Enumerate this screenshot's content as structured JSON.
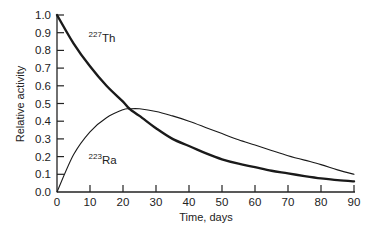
{
  "chart_data": {
    "type": "line",
    "title": "",
    "xlabel": "Time, days",
    "ylabel": "Relative activity",
    "xlim": [
      0,
      90
    ],
    "ylim": [
      0.0,
      1.0
    ],
    "grid": false,
    "legend": "inline labels",
    "x_ticks": [
      0,
      10,
      20,
      30,
      40,
      50,
      60,
      70,
      80,
      90
    ],
    "x_tick_labels": [
      "0",
      "10",
      "20",
      "30",
      "40",
      "50",
      "60",
      "70",
      "80",
      "90"
    ],
    "y_ticks": [
      0.0,
      0.1,
      0.2,
      0.3,
      0.4,
      0.5,
      0.6,
      0.7,
      0.8,
      0.9,
      1.0
    ],
    "y_tick_labels": [
      "0.0",
      "0.1",
      "0.2",
      "0.3",
      "0.4",
      "0.5",
      "0.6",
      "0.7",
      "0.8",
      "0.9",
      "1.0"
    ],
    "x": [
      0,
      5,
      10,
      15,
      20,
      22,
      25,
      30,
      35,
      40,
      45,
      50,
      55,
      60,
      65,
      70,
      75,
      80,
      85,
      90
    ],
    "series": [
      {
        "name": "227Th",
        "label_mass": "227",
        "label_symbol": "Th",
        "style": "thick",
        "values": [
          1.0,
          0.84,
          0.71,
          0.6,
          0.51,
          0.47,
          0.43,
          0.36,
          0.3,
          0.26,
          0.22,
          0.185,
          0.16,
          0.14,
          0.12,
          0.105,
          0.09,
          0.077,
          0.067,
          0.06
        ]
      },
      {
        "name": "223Ra",
        "label_mass": "223",
        "label_symbol": "Ra",
        "style": "thin",
        "values": [
          0.0,
          0.21,
          0.34,
          0.42,
          0.465,
          0.47,
          0.47,
          0.455,
          0.43,
          0.4,
          0.365,
          0.33,
          0.295,
          0.265,
          0.235,
          0.205,
          0.18,
          0.155,
          0.125,
          0.1
        ]
      }
    ],
    "annotations": [
      {
        "text": "227Th",
        "x": 12,
        "y": 0.88
      },
      {
        "text": "223Ra",
        "x": 12,
        "y": 0.19
      }
    ]
  }
}
